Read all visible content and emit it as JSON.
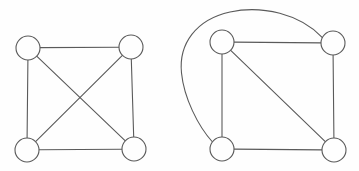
{
  "figure": {
    "background_color": "#fefefe",
    "stroke_color": "#5a5a5a",
    "node_fill_color": "#fefefe",
    "stroke_width": 1.1,
    "width": 359,
    "height": 171
  },
  "graphs": [
    {
      "id": "left-graph",
      "name": "complete-graph-k4",
      "description": "Four nodes arranged in a square with both diagonals drawn, forming a complete graph on four vertices.",
      "node_radius": 12,
      "nodes": [
        {
          "id": "L-TL",
          "name": "top-left-node",
          "cx": 28,
          "cy": 48
        },
        {
          "id": "L-TR",
          "name": "top-right-node",
          "cx": 131,
          "cy": 47
        },
        {
          "id": "L-BL",
          "name": "bottom-left-node",
          "cx": 27,
          "cy": 150
        },
        {
          "id": "L-BR",
          "name": "bottom-right-node",
          "cx": 134,
          "cy": 149
        }
      ],
      "edges": [
        {
          "id": "L-E1",
          "name": "top-edge",
          "from": "L-TL",
          "to": "L-TR",
          "curved": false
        },
        {
          "id": "L-E2",
          "name": "left-edge",
          "from": "L-TL",
          "to": "L-BL",
          "curved": false
        },
        {
          "id": "L-E3",
          "name": "right-edge",
          "from": "L-TR",
          "to": "L-BR",
          "curved": false
        },
        {
          "id": "L-E4",
          "name": "bottom-edge",
          "from": "L-BL",
          "to": "L-BR",
          "curved": false
        },
        {
          "id": "L-E5",
          "name": "diagonal-edge-tl-br",
          "from": "L-TL",
          "to": "L-BR",
          "curved": false
        },
        {
          "id": "L-E6",
          "name": "diagonal-edge-tr-bl",
          "from": "L-TR",
          "to": "L-BL",
          "curved": false
        }
      ],
      "edge_count": 6,
      "node_count": 4
    },
    {
      "id": "right-graph",
      "name": "graph-with-external-curved-edge",
      "description": "Four nodes arranged in a square with one diagonal and one long curved edge routed outside the square connecting the top-right node to the bottom-left node.",
      "node_radius": 12,
      "nodes": [
        {
          "id": "R-TL",
          "name": "top-left-node",
          "cx": 222,
          "cy": 42
        },
        {
          "id": "R-TR",
          "name": "top-right-node",
          "cx": 333,
          "cy": 43
        },
        {
          "id": "R-BL",
          "name": "bottom-left-node",
          "cx": 222,
          "cy": 149
        },
        {
          "id": "R-BR",
          "name": "bottom-right-node",
          "cx": 334,
          "cy": 150
        }
      ],
      "edges": [
        {
          "id": "R-E1",
          "name": "top-edge",
          "from": "R-TL",
          "to": "R-TR",
          "curved": false
        },
        {
          "id": "R-E2",
          "name": "left-edge",
          "from": "R-TL",
          "to": "R-BL",
          "curved": false
        },
        {
          "id": "R-E3",
          "name": "right-edge",
          "from": "R-TR",
          "to": "R-BR",
          "curved": false
        },
        {
          "id": "R-E4",
          "name": "bottom-edge",
          "from": "R-BL",
          "to": "R-BR",
          "curved": false
        },
        {
          "id": "R-E5",
          "name": "diagonal-edge-tl-br",
          "from": "R-TL",
          "to": "R-BR",
          "curved": false
        },
        {
          "id": "R-E6",
          "name": "curved-outer-edge-tr-bl",
          "from": "R-TR",
          "to": "R-BL",
          "curved": true,
          "apex_x": 250,
          "apex_y": 9,
          "leftmost_x": 181,
          "leftmost_y": 67
        }
      ],
      "edge_count": 6,
      "node_count": 4
    }
  ],
  "paths": {
    "left": {
      "top": "M 40 47.6 L 119 47.3",
      "left": "M 27.9 60 L 27.1 138",
      "right": "M 131.3 59 L 133.7 137",
      "bottom": "M 39 149.7 L 122 149.2",
      "diag_tl_br": "M 36.7 56.2 L 125.3 140.8",
      "diag_tr_bl": "M 122.4 55.3 L 35.6 141.7"
    },
    "right": {
      "top": "M 234 42.1 L 321 42.9",
      "left": "M 222 54 L 222 137",
      "right": "M 333.1 55 L 333.9 138",
      "bottom": "M 234 149.1 L 322 149.9",
      "diag_tl_br": "M 230.7 50.3 L 325.3 141.7",
      "curve_outer": "M 322.4 37.6 C 300 14, 262 5, 230 12 C 196 19.5, 178.5 44, 181.5 73 C 184 98, 198 126, 212.5 142"
    }
  }
}
